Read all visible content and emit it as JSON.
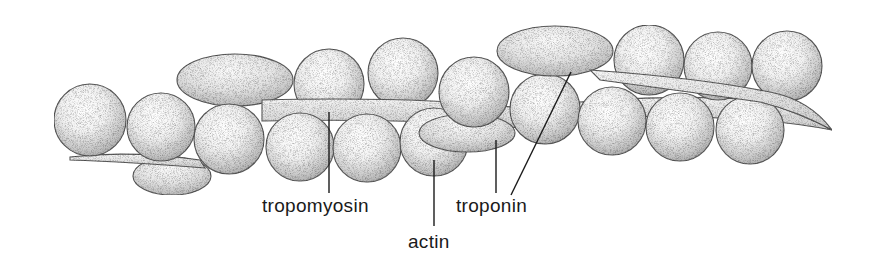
{
  "figure": {
    "background_color": "#ffffff",
    "outline_color": "#5a5a5a",
    "stipple_color": "#6b6b6b"
  },
  "labels": {
    "tropomyosin": "tropomyosin",
    "actin": "actin",
    "troponin": "troponin"
  },
  "components": [
    {
      "name": "actin",
      "description": "chain of globular monomers forming double helix"
    },
    {
      "name": "tropomyosin",
      "description": "long thin strand lying in groove of actin helix"
    },
    {
      "name": "troponin",
      "description": "elongated complexes bound to tropomyosin"
    }
  ]
}
